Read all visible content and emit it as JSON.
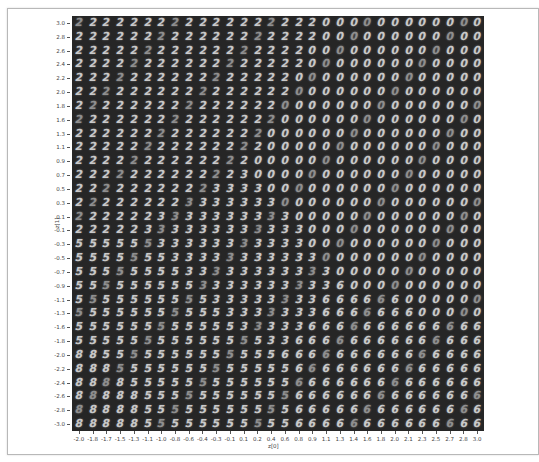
{
  "chart_data": {
    "type": "heatmap",
    "title": "",
    "xlabel": "z[0]",
    "ylabel": "z[1]",
    "xlim": [
      -2.0,
      3.0
    ],
    "ylim": [
      -3.0,
      3.0
    ],
    "grid": false,
    "x_ticks": [
      "-2.0",
      "-1.8",
      "-1.7",
      "-1.5",
      "-1.3",
      "-1.1",
      "-1.0",
      "-0.8",
      "-0.6",
      "-0.4",
      "-0.3",
      "-0.1",
      "0.1",
      "0.2",
      "0.4",
      "0.6",
      "0.8",
      "0.9",
      "1.1",
      "1.3",
      "1.4",
      "1.6",
      "1.8",
      "2.0",
      "2.1",
      "2.3",
      "2.5",
      "2.7",
      "2.8",
      "3.0"
    ],
    "y_ticks": [
      "3.0",
      "2.8",
      "2.6",
      "2.4",
      "2.2",
      "2.0",
      "1.8",
      "1.6",
      "1.3",
      "1.1",
      "0.9",
      "0.7",
      "0.5",
      "0.3",
      "0.1",
      "-0.1",
      "-0.3",
      "-0.5",
      "-0.7",
      "-0.9",
      "-1.1",
      "-1.3",
      "-1.6",
      "-1.8",
      "-2.0",
      "-2.2",
      "-2.4",
      "-2.6",
      "-2.8",
      "-3.0"
    ],
    "digit_grid": [
      "222222222222222222000000000000",
      "222222222222222222000000000000",
      "222222222222222220000000000000",
      "222222222222222220000000000000",
      "222222222222222200000000000000",
      "222222222222222200000000000000",
      "222222222222222000000000000000",
      "222222222222222000000000000000",
      "222222222222220000000000000000",
      "222222222222220000000000000000",
      "222222222222200000000000000000",
      "222222222222300000000000000000",
      "222222222233330000000000000000",
      "222222223333333000000000000000",
      "222222333333333300000000000000",
      "222223333333333330000000000000",
      "555555333333333330000000000000",
      "555555533333333333000000000000",
      "555555553333333333300000000000",
      "555555555333333333360000000000",
      "555555555533333333666666000000",
      "555555555553333333666666600000",
      "555555555555333336666666666666",
      "555555555555553366666666666666",
      "885555555555555666666666666666",
      "888555555555555566666666666666",
      "888855555555555566666666666666",
      "888885555555555566666666666666",
      "888885555555555566666666666666",
      "888885555555555566666666666666"
    ],
    "colors": {
      "background": "#262626",
      "digit": "#c9c9c9"
    }
  }
}
